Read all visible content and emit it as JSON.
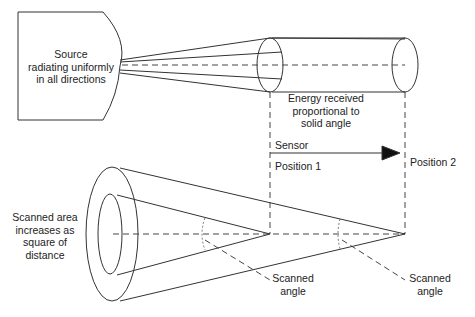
{
  "diagram": {
    "source_label": [
      "Source",
      "radiating uniformly",
      "in all directions"
    ],
    "energy_label": [
      "Energy received",
      "proportional to",
      "solid angle"
    ],
    "sensor_label": "Sensor",
    "position1_label": "Position 1",
    "position2_label": "Position 2",
    "scanned_area_label": [
      "Scanned area",
      "increases as",
      "square of",
      "distance"
    ],
    "scanned_angle_1": [
      "Scanned",
      "angle"
    ],
    "scanned_angle_2": [
      "Scanned",
      "angle"
    ]
  },
  "colors": {
    "line": "#333333",
    "text": "#222222",
    "background": "#ffffff"
  }
}
